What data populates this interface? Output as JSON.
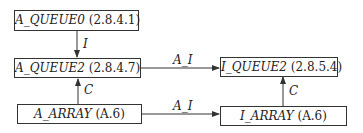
{
  "nodes": [
    {
      "id": "a_queue0",
      "name": "A_QUEUE0",
      "ref": "(2.8.4.1)"
    },
    {
      "id": "a_queue2",
      "name": "A_QUEUE2",
      "ref": "(2.8.4.7)"
    },
    {
      "id": "a_array",
      "name": "A_ARRAY",
      "ref": "(A.6)"
    },
    {
      "id": "i_queue2",
      "name": "I_QUEUE2",
      "ref": "(2.8.5.4)"
    },
    {
      "id": "i_array",
      "name": "I_ARRAY",
      "ref": "(A.6)"
    }
  ],
  "edges": [
    {
      "from": "a_queue0",
      "to": "a_queue2",
      "label": "I"
    },
    {
      "from": "a_array",
      "to": "a_queue2",
      "label": "C"
    },
    {
      "from": "a_queue2",
      "to": "i_queue2",
      "label": "A_I"
    },
    {
      "from": "a_array",
      "to": "i_array",
      "label": "A_I"
    },
    {
      "from": "i_array",
      "to": "i_queue2",
      "label": "C"
    }
  ]
}
